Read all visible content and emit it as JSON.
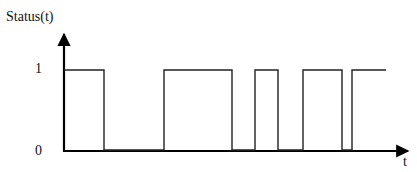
{
  "chart_data": {
    "type": "line",
    "subtype": "step",
    "title": "",
    "xlabel": "t",
    "ylabel": "Status(t)",
    "yticks": [
      "0",
      "1"
    ],
    "ylim": [
      0,
      1
    ],
    "grid": false,
    "legend": null,
    "series": [
      {
        "name": "Status(t)",
        "pulses": [
          {
            "start": 0,
            "end": 40
          },
          {
            "start": 100,
            "end": 168
          },
          {
            "start": 191,
            "end": 214
          },
          {
            "start": 239,
            "end": 278
          },
          {
            "start": 288,
            "end": 322
          }
        ],
        "x": [
          0,
          40,
          40,
          100,
          100,
          168,
          168,
          191,
          191,
          214,
          214,
          239,
          239,
          278,
          278,
          288,
          288,
          322
        ],
        "y": [
          1,
          1,
          0,
          0,
          1,
          1,
          0,
          0,
          1,
          1,
          0,
          0,
          1,
          1,
          0,
          0,
          1,
          1
        ]
      }
    ]
  },
  "axes": {
    "y_label": "Status(t)",
    "x_label": "t",
    "tick_high": "1",
    "tick_low": "0"
  },
  "colors": {
    "line": "#111111",
    "axis": "#000000",
    "background": "#ffffff"
  }
}
